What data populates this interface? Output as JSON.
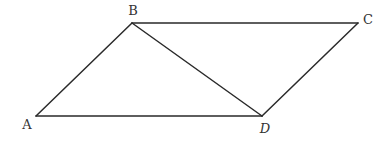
{
  "diagram": {
    "type": "parallelogram",
    "vertices": {
      "A": {
        "label": "A",
        "x": 36,
        "y": 116,
        "lx": 27,
        "ly": 129,
        "italic": false
      },
      "B": {
        "label": "B",
        "x": 132,
        "y": 23,
        "lx": 133,
        "ly": 15,
        "italic": false
      },
      "C": {
        "label": "C",
        "x": 358,
        "y": 23,
        "lx": 368,
        "ly": 24,
        "italic": false
      },
      "D": {
        "label": "D",
        "x": 262,
        "y": 116,
        "lx": 265,
        "ly": 133,
        "italic": true
      }
    },
    "edges": [
      {
        "from": "A",
        "to": "B"
      },
      {
        "from": "B",
        "to": "C"
      },
      {
        "from": "C",
        "to": "D"
      },
      {
        "from": "D",
        "to": "A"
      },
      {
        "from": "B",
        "to": "D"
      }
    ],
    "colors": {
      "line": "#2a2a2a",
      "label": "#333333",
      "background": "#ffffff"
    }
  }
}
